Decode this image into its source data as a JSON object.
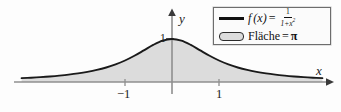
{
  "figure": {
    "background_color": "#fdfdfd",
    "curve_color": "#1a1a1a",
    "fill_color": "#dcdcdc",
    "axis_color": "#8a8a8a"
  },
  "axes": {
    "x_label": "x",
    "y_label": "y",
    "x_ticks": [
      {
        "label": "−1",
        "value": -1
      },
      {
        "label": "1",
        "value": 1
      }
    ],
    "y_ticks": [
      {
        "label": "1",
        "value": 1
      }
    ]
  },
  "legend": {
    "border_color": "#6d6d6d",
    "rows": [
      {
        "swatch": "line-swatch",
        "fn_name": "f",
        "fn_arg": "(x)",
        "equals": "=",
        "numerator": "1",
        "denominator_base": "1+x",
        "denominator_exponent": "2"
      },
      {
        "swatch": "box-swatch",
        "label": "Fläche",
        "equals": "=",
        "value": "π"
      }
    ]
  },
  "chart_data": {
    "type": "line",
    "title": "",
    "xlabel": "x",
    "ylabel": "y",
    "grid": false,
    "legend_position": "top-right",
    "xlim": [
      -3.2,
      3.2
    ],
    "ylim": [
      0,
      1.18
    ],
    "series": [
      {
        "name": "f(x) = 1/(1+x^2)",
        "fill": "Fläche = π",
        "x": [
          -3.2,
          -3.0,
          -2.8,
          -2.6,
          -2.4,
          -2.2,
          -2.0,
          -1.8,
          -1.6,
          -1.4,
          -1.2,
          -1.0,
          -0.8,
          -0.6,
          -0.4,
          -0.2,
          0.0,
          0.2,
          0.4,
          0.6,
          0.8,
          1.0,
          1.2,
          1.4,
          1.6,
          1.8,
          2.0,
          2.2,
          2.4,
          2.6,
          2.8,
          3.0,
          3.2
        ],
        "y": [
          0.089,
          0.1,
          0.113,
          0.129,
          0.148,
          0.171,
          0.2,
          0.236,
          0.281,
          0.338,
          0.41,
          0.5,
          0.61,
          0.735,
          0.862,
          0.962,
          1.0,
          0.962,
          0.862,
          0.735,
          0.61,
          0.5,
          0.41,
          0.338,
          0.281,
          0.236,
          0.2,
          0.171,
          0.148,
          0.129,
          0.113,
          0.1,
          0.089
        ]
      }
    ],
    "annotations": [
      {
        "text": "1",
        "axis": "y",
        "at": 1
      },
      {
        "text": "−1",
        "axis": "x",
        "at": -1
      },
      {
        "text": "1",
        "axis": "x",
        "at": 1
      }
    ]
  }
}
